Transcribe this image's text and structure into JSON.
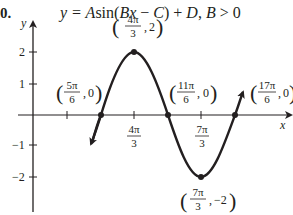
{
  "label": "0.",
  "title": {
    "prefix": "y = ",
    "A": "A",
    "sin": "sin(",
    "Bx": "Bx",
    "minus": " − ",
    "C": "C",
    "close": ") + ",
    "D": "D",
    "cond": ", ",
    "B": "B",
    "gt": " > 0"
  },
  "axes": {
    "x_label": "x",
    "y_label": "y"
  },
  "y_ticks": [
    {
      "label": "2",
      "value": 2
    },
    {
      "label": "1",
      "value": 1
    },
    {
      "label": "−1",
      "value": -1
    },
    {
      "label": "−2",
      "value": -2
    }
  ],
  "x_ticks": [
    {
      "num": "4π",
      "den": "3"
    },
    {
      "num": "7π",
      "den": "3"
    }
  ],
  "points": [
    {
      "name": "max",
      "num": "4π",
      "den": "3",
      "y": "2"
    },
    {
      "name": "zero1",
      "num": "5π",
      "den": "6",
      "y": "0"
    },
    {
      "name": "zero2",
      "num": "11π",
      "den": "6",
      "y": "0"
    },
    {
      "name": "zero3",
      "num": "17π",
      "den": "6",
      "y": "0"
    },
    {
      "name": "min",
      "num": "7π",
      "den": "3",
      "y": "−2"
    }
  ],
  "colors": {
    "ink": "#231f20"
  }
}
